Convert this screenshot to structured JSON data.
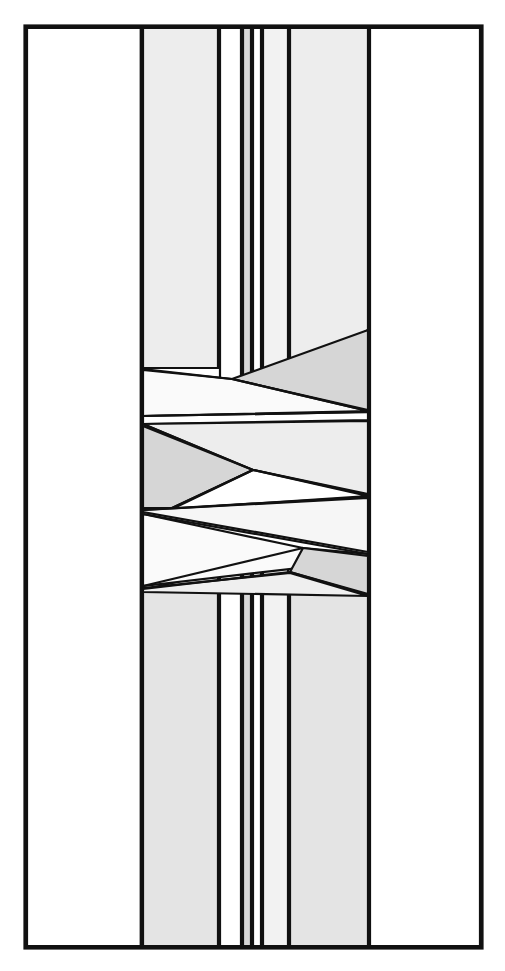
{
  "figure": {
    "type": "technical-line-drawing",
    "canvas": {
      "width": 505,
      "height": 971
    },
    "palette": {
      "background": "#ffffff",
      "outline": "#111111",
      "fill_white": "#ffffff",
      "fill_light": "#f0f0f0",
      "fill_medium": "#e2e2e2",
      "fill_dark": "#d2d2d2"
    },
    "frame": {
      "name": "outer-border",
      "x": 25,
      "y": 26,
      "width": 457,
      "height": 922,
      "fill": "#ffffff"
    },
    "outer_margins": [
      {
        "name": "left-margin-panel",
        "fill": "#ffffff",
        "points": "27,28 141,28 141,946 27,946"
      },
      {
        "name": "right-margin-panel",
        "fill": "#ffffff",
        "points": "370,28 480,28 480,946 370,946"
      }
    ],
    "upper_bands": [
      {
        "name": "band-u1",
        "fill": "#ededed",
        "points": "143,28 218,28 218,368 143,368"
      },
      {
        "name": "band-u2",
        "fill": "#ffffff",
        "points": "220,28 241,28 241,406 220,406"
      },
      {
        "name": "band-u3",
        "fill": "#d8d8d8",
        "points": "243,28 251,28 251,413 243,413"
      },
      {
        "name": "band-u4",
        "fill": "#ffffff",
        "points": "253,28 261,28 261,409 253,409"
      },
      {
        "name": "band-u5",
        "fill": "#f2f2f2",
        "points": "263,28 288,28 288,400 263,400"
      },
      {
        "name": "band-u6",
        "fill": "#ededed",
        "points": "290,28 368,28 368,330 290,375"
      }
    ],
    "crossing_shapes": [
      {
        "name": "wedge-upper-right-dark",
        "fill": "#d6d6d6",
        "points": "368,330 368,410 232,379"
      },
      {
        "name": "wedge-upper-left-white",
        "fill": "#fafafa",
        "points": "143,370 232,379 368,411 143,416"
      },
      {
        "name": "sliver-upper-right",
        "fill": "#ffffff",
        "points": "143,416 368,412 368,420 143,424"
      },
      {
        "name": "wedge-mid-left-dark",
        "fill": "#d6d6d6",
        "points": "143,426 253,470 172,508 143,508"
      },
      {
        "name": "wedge-mid-upper",
        "fill": "#ededed",
        "points": "143,424 368,421 368,494 253,470"
      },
      {
        "name": "wedge-mid-inner-white",
        "fill": "#ffffff",
        "points": "253,470 368,496 172,509"
      },
      {
        "name": "wedge-mid-lower-left",
        "fill": "#f6f6f6",
        "points": "143,510 368,498 368,552 143,512"
      },
      {
        "name": "wedge-lower-white",
        "fill": "#fafafa",
        "points": "143,514 303,548 368,554 368,560 143,586"
      },
      {
        "name": "wedge-lower-right-dark",
        "fill": "#d6d6d6",
        "points": "303,548 368,556 368,594 290,572"
      },
      {
        "name": "wedge-lower-left-light",
        "fill": "#efefef",
        "points": "143,588 290,573 368,596 143,592"
      }
    ],
    "lower_bands": [
      {
        "name": "band-l1",
        "fill": "#e4e4e4",
        "points": "143,590 218,572 218,946 143,946"
      },
      {
        "name": "band-l2",
        "fill": "#ffffff",
        "points": "220,571 241,566 241,946 220,946"
      },
      {
        "name": "band-l3",
        "fill": "#d8d8d8",
        "points": "243,566 251,563 251,946 243,946"
      },
      {
        "name": "band-l4",
        "fill": "#ffffff",
        "points": "253,563 261,561 261,946 253,946"
      },
      {
        "name": "band-l5",
        "fill": "#f2f2f2",
        "points": "263,561 288,556 288,946 263,946"
      },
      {
        "name": "band-l6",
        "fill": "#e4e4e4",
        "points": "290,572 368,596 368,946 290,946"
      }
    ],
    "accent_lines": [
      {
        "name": "divider-upper-wedge",
        "x1": 143,
        "y1": 369,
        "x2": 232,
        "y2": 379
      },
      {
        "name": "divider-crossing-a",
        "x1": 232,
        "y1": 379,
        "x2": 368,
        "y2": 411
      },
      {
        "name": "divider-crossing-b",
        "x1": 143,
        "y1": 416,
        "x2": 368,
        "y2": 412
      },
      {
        "name": "divider-crossing-c",
        "x1": 143,
        "y1": 424,
        "x2": 253,
        "y2": 470
      },
      {
        "name": "divider-crossing-d",
        "x1": 253,
        "y1": 470,
        "x2": 368,
        "y2": 495
      },
      {
        "name": "divider-crossing-e",
        "x1": 253,
        "y1": 470,
        "x2": 172,
        "y2": 508
      },
      {
        "name": "divider-crossing-f",
        "x1": 143,
        "y1": 510,
        "x2": 368,
        "y2": 497
      },
      {
        "name": "divider-crossing-g",
        "x1": 143,
        "y1": 514,
        "x2": 368,
        "y2": 554
      },
      {
        "name": "divider-crossing-h",
        "x1": 303,
        "y1": 548,
        "x2": 143,
        "y2": 586
      },
      {
        "name": "divider-crossing-i",
        "x1": 290,
        "y1": 572,
        "x2": 368,
        "y2": 595
      },
      {
        "name": "divider-lower-wedge",
        "x1": 143,
        "y1": 589,
        "x2": 290,
        "y2": 572
      }
    ],
    "vertical_rails": [
      {
        "name": "rail-left-inner",
        "x1": 141,
        "y1": 28,
        "x2": 141,
        "y2": 946
      },
      {
        "name": "rail-right-inner",
        "x1": 369,
        "y1": 28,
        "x2": 369,
        "y2": 946
      }
    ]
  },
  "chart_data": {
    "type": "diagram-geometry",
    "strand_count": 6,
    "crossing_zone": {
      "top": 330,
      "bottom": 596
    },
    "strand_top_x_ranges": [
      [
        143,
        218
      ],
      [
        220,
        241
      ],
      [
        243,
        251
      ],
      [
        253,
        261
      ],
      [
        263,
        288
      ],
      [
        290,
        368
      ]
    ],
    "strand_bottom_x_ranges": [
      [
        143,
        218
      ],
      [
        220,
        241
      ],
      [
        243,
        251
      ],
      [
        253,
        261
      ],
      [
        263,
        288
      ],
      [
        290,
        368
      ]
    ],
    "gray_levels": [
      "#ffffff",
      "#fafafa",
      "#f2f2f2",
      "#ededed",
      "#e4e4e4",
      "#d8d8d8",
      "#d6d6d6"
    ]
  }
}
